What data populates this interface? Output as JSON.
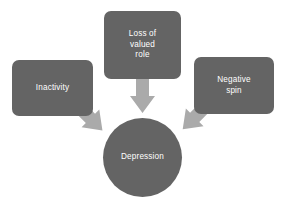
{
  "diagram": {
    "colors": {
      "node_fill": "#646464",
      "node_text": "#ffffff",
      "arrow_fill": "#aaaaaa",
      "background": "#ffffff"
    },
    "nodes": [
      {
        "id": "inactivity",
        "label": "Inactivity",
        "shape": "rounded-rectangle"
      },
      {
        "id": "loss-of-valued-role",
        "label": "Loss of\nvalued\nrole",
        "shape": "rounded-rectangle"
      },
      {
        "id": "negative-spin",
        "label": "Negative\nspin",
        "shape": "rounded-rectangle"
      },
      {
        "id": "depression",
        "label": "Depression",
        "shape": "circle"
      }
    ],
    "arrows": [
      {
        "id": "inactivity-to-depression",
        "from": "inactivity",
        "to": "depression",
        "direction": "down-right"
      },
      {
        "id": "loss-of-valued-role-to-depression",
        "from": "loss-of-valued-role",
        "to": "depression",
        "direction": "down"
      },
      {
        "id": "negative-spin-to-depression",
        "from": "negative-spin",
        "to": "depression",
        "direction": "down-left"
      }
    ]
  }
}
